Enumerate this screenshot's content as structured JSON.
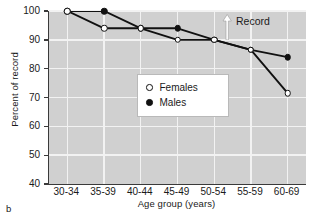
{
  "panel": {
    "label": "b"
  },
  "annotation": {
    "record_label": "Record",
    "arrow_icon": "up-arrow-icon"
  },
  "chart_data": {
    "type": "line",
    "title": "",
    "xlabel": "Age group (years)",
    "ylabel": "Percent of record",
    "categories": [
      "30-34",
      "35-39",
      "40-44",
      "45-49",
      "50-54",
      "55-59",
      "60-69"
    ],
    "series": [
      {
        "name": "Females",
        "marker": "open-circle",
        "color": "#111111",
        "values": [
          100,
          94,
          94,
          90,
          90,
          86.5,
          71.5
        ]
      },
      {
        "name": "Males",
        "marker": "filled-circle",
        "color": "#111111",
        "values": [
          100,
          100,
          94,
          94,
          90,
          86.5,
          84
        ]
      }
    ],
    "ylim": [
      40,
      100
    ],
    "yticks": [
      40,
      50,
      60,
      70,
      80,
      90,
      100
    ],
    "grid": true,
    "legend_position": "center",
    "plot_background": "#d0d0d0",
    "gridline_color": "#f2f2f2",
    "axis_color": "#3a3a3a"
  }
}
